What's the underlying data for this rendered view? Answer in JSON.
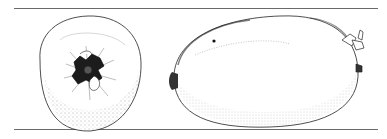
{
  "figure": {
    "views": [
      {
        "name": "end view",
        "label": "calyx end view"
      },
      {
        "name": "side view",
        "label": "lateral view"
      }
    ],
    "colors": {
      "ink": "#1a1a1a",
      "paper": "#ffffff",
      "rule": "#6a6a6a"
    }
  }
}
